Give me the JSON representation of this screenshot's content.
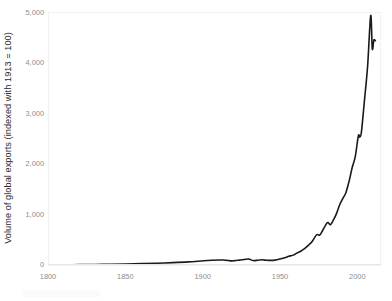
{
  "chart_data": {
    "type": "line",
    "title": "",
    "subtitle": "",
    "xlabel": "",
    "ylabel": "Volume of global exports (indexed with 1913 = 100)",
    "xlim": [
      1800,
      2014
    ],
    "ylim": [
      0,
      5000
    ],
    "grid": false,
    "legend": "none",
    "background": "#ffffff",
    "line_color": "#1a1a1a",
    "line_width": 1.6,
    "tick_label_color": "#8d8d8d",
    "axis_label_color": "#2b2b2b",
    "plot_border_color": "#f2f2f2",
    "xticks": [
      1800,
      1850,
      1900,
      1950,
      2000
    ],
    "xtick_labels": [
      "1800",
      "1850",
      "1900",
      "1950",
      "2000"
    ],
    "yticks": [
      0,
      1000,
      2000,
      3000,
      4000,
      5000
    ],
    "ytick_labels": [
      "0",
      "1,000",
      "2,000",
      "3,000",
      "4,000",
      "5,000"
    ],
    "series": [
      {
        "name": "Volume of global exports",
        "color": "#1a1a1a",
        "x": [
          1800,
          1810,
          1820,
          1830,
          1840,
          1850,
          1860,
          1870,
          1880,
          1890,
          1900,
          1905,
          1910,
          1913,
          1916,
          1918,
          1920,
          1923,
          1925,
          1929,
          1932,
          1935,
          1938,
          1940,
          1945,
          1948,
          1950,
          1953,
          1955,
          1958,
          1960,
          1963,
          1965,
          1968,
          1970,
          1973,
          1975,
          1977,
          1980,
          1982,
          1984,
          1986,
          1988,
          1990,
          1992,
          1994,
          1996,
          1998,
          2000,
          2001,
          2002,
          2004,
          2006,
          2008,
          2009,
          2010,
          2011
        ],
        "y": [
          3,
          5,
          7,
          10,
          14,
          20,
          27,
          36,
          47,
          62,
          85,
          94,
          99,
          100,
          88,
          82,
          86,
          97,
          105,
          118,
          88,
          95,
          103,
          96,
          92,
          108,
          122,
          150,
          172,
          196,
          233,
          279,
          320,
          400,
          460,
          600,
          592,
          690,
          840,
          800,
          900,
          1030,
          1200,
          1320,
          1440,
          1660,
          1930,
          2150,
          2560,
          2540,
          2640,
          3280,
          3950,
          4950,
          4290,
          4460,
          4450
        ]
      }
    ],
    "annotations": [],
    "notes": {
      "peak_value": 4950,
      "peak_year": 2008,
      "base_year": 1913,
      "base_value": 100
    }
  }
}
